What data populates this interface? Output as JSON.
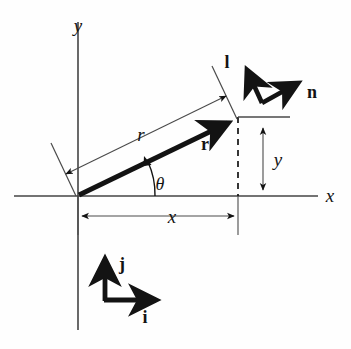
{
  "figure": {
    "background_color": "#fefefe",
    "ink_color": "#131313",
    "labels": {
      "axis_x": "x",
      "axis_y": "y",
      "vector_r_bold": "r",
      "length_r_italic": "r",
      "angle_theta": "θ",
      "dim_x": "x",
      "dim_y": "y",
      "unit_l": "l",
      "unit_n": "n",
      "basis_i": "i",
      "basis_j": "j"
    },
    "geometry": {
      "origin": [
        78,
        196
      ],
      "axis_x_start": [
        14,
        196
      ],
      "axis_x_end": [
        318,
        196
      ],
      "axis_y_top": [
        78,
        22
      ],
      "axis_y_bottom": [
        78,
        330
      ],
      "vector_r_tip": [
        238,
        117
      ],
      "unit_vertex": [
        262,
        103
      ],
      "unit_l_tip": [
        243,
        62
      ],
      "unit_n_tip": [
        305,
        80
      ],
      "basis_vertex": [
        105,
        300
      ],
      "basis_j_tip": [
        105,
        251
      ],
      "basis_i_tip": [
        163,
        300
      ],
      "dashed_line_x": 238,
      "dim_r_offset": 30,
      "theta_degrees": 28
    },
    "elements": {
      "x_axis": "horizontal-axis",
      "y_axis": "vertical-axis",
      "position_vector": "bold-arrow-r",
      "dimension_r": "double-headed-arrow-r",
      "dimension_x": "double-headed-arrow-x",
      "dimension_y": "double-headed-arrow-y",
      "projection_line": "dashed-vertical-projection",
      "angle_arc": "theta-arc",
      "unit_vector_l": "bold-arrow-l",
      "unit_vector_n": "bold-arrow-n",
      "basis_vector_i": "bold-arrow-i",
      "basis_vector_j": "bold-arrow-j"
    }
  }
}
